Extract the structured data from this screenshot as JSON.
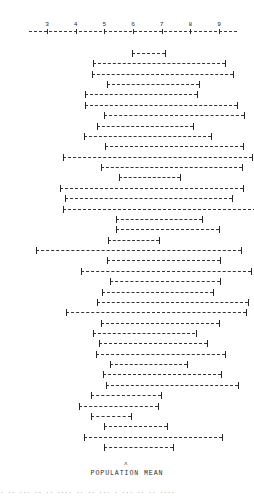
{
  "chart_data": {
    "type": "line",
    "title": "",
    "xlabel": "POPULATION MEAN",
    "ylabel": "",
    "xlim": [
      2.5,
      9.5
    ],
    "grid": false,
    "legend": null,
    "axis_ticks": [
      3,
      4,
      5,
      6,
      7,
      8,
      9
    ],
    "axis_tick_labels": [
      "3",
      "4",
      "5",
      "6",
      "7",
      "8",
      "9"
    ],
    "population_mean_marker": 5.75,
    "series_description": "Confidence intervals for repeated samples, each drawn as a horizontal dashed line with end caps",
    "intervals": [
      {
        "index": 1,
        "lower": 5.98,
        "upper": 7.1
      },
      {
        "index": 2,
        "lower": 4.6,
        "upper": 9.2
      },
      {
        "index": 3,
        "lower": 4.58,
        "upper": 9.5
      },
      {
        "index": 4,
        "lower": 5.08,
        "upper": 8.3
      },
      {
        "index": 5,
        "lower": 4.32,
        "upper": 8.22
      },
      {
        "index": 6,
        "lower": 4.33,
        "upper": 9.62
      },
      {
        "index": 7,
        "lower": 5.0,
        "upper": 9.88
      },
      {
        "index": 8,
        "lower": 4.75,
        "upper": 8.1
      },
      {
        "index": 9,
        "lower": 4.3,
        "upper": 8.72
      },
      {
        "index": 10,
        "lower": 5.02,
        "upper": 9.85
      },
      {
        "index": 11,
        "lower": 3.55,
        "upper": 10.15
      },
      {
        "index": 12,
        "lower": 4.88,
        "upper": 9.8
      },
      {
        "index": 13,
        "lower": 5.52,
        "upper": 7.65
      },
      {
        "index": 14,
        "lower": 3.44,
        "upper": 9.82
      },
      {
        "index": 15,
        "lower": 3.62,
        "upper": 9.45
      },
      {
        "index": 16,
        "lower": 3.55,
        "upper": 11.0
      },
      {
        "index": 17,
        "lower": 5.4,
        "upper": 8.42
      },
      {
        "index": 18,
        "lower": 5.42,
        "upper": 9.0
      },
      {
        "index": 19,
        "lower": 5.12,
        "upper": 6.9
      },
      {
        "index": 20,
        "lower": 2.62,
        "upper": 9.75
      },
      {
        "index": 21,
        "lower": 5.1,
        "upper": 9.05
      },
      {
        "index": 22,
        "lower": 4.2,
        "upper": 10.1
      },
      {
        "index": 23,
        "lower": 5.18,
        "upper": 9.02
      },
      {
        "index": 24,
        "lower": 4.92,
        "upper": 8.8
      },
      {
        "index": 25,
        "lower": 4.75,
        "upper": 10.0
      },
      {
        "index": 26,
        "lower": 3.68,
        "upper": 9.95
      },
      {
        "index": 27,
        "lower": 4.88,
        "upper": 9.0
      },
      {
        "index": 28,
        "lower": 4.6,
        "upper": 8.18
      },
      {
        "index": 29,
        "lower": 4.8,
        "upper": 8.58
      },
      {
        "index": 30,
        "lower": 4.72,
        "upper": 9.22
      },
      {
        "index": 31,
        "lower": 5.2,
        "upper": 7.9
      },
      {
        "index": 32,
        "lower": 4.95,
        "upper": 9.08
      },
      {
        "index": 33,
        "lower": 5.05,
        "upper": 9.65
      },
      {
        "index": 34,
        "lower": 4.55,
        "upper": 6.98
      },
      {
        "index": 35,
        "lower": 4.12,
        "upper": 6.88
      },
      {
        "index": 36,
        "lower": 4.55,
        "upper": 5.92
      },
      {
        "index": 37,
        "lower": 5.0,
        "upper": 7.18
      },
      {
        "index": 38,
        "lower": 4.3,
        "upper": 9.12
      },
      {
        "index": 39,
        "lower": 4.98,
        "upper": 7.38
      }
    ]
  },
  "figure": {
    "axis_label": "POPULATION MEAN",
    "mean_marker_glyph": "ʌ",
    "caption_partial": "· ·· ··· ·· ·· ···· ·· ·· ··· · ··· ·· ·· ····"
  }
}
